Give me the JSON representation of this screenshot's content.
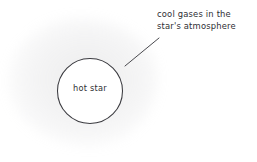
{
  "diagram": {
    "background_color": "#ffffff",
    "ink_color": "#3b3b40",
    "star": {
      "label": "hot star",
      "shape": "circle",
      "center_x": 90,
      "center_y": 91,
      "radius": 32.5,
      "fill_color": "#ffffff",
      "stroke_color": "#3b3b40"
    },
    "annotation": {
      "line1": "cool gases in the",
      "line2": "star's atmosphere",
      "text_color": "#2e2e33"
    },
    "leader": {
      "x1": 125,
      "y1": 66,
      "x2": 159,
      "y2": 38,
      "stroke_color": "#4a4a4f"
    }
  }
}
